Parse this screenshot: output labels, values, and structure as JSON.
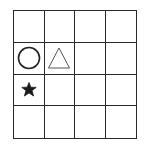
{
  "grid": {
    "rows": 4,
    "cols": 4,
    "line_color": "#2a2a2a",
    "shapes": [
      {
        "row": 1,
        "col": 0,
        "shape": "circle",
        "name": "circle-icon",
        "stroke": "#222222",
        "fill": "none"
      },
      {
        "row": 1,
        "col": 1,
        "shape": "triangle",
        "name": "triangle-icon",
        "stroke": "#555555",
        "fill": "none"
      },
      {
        "row": 2,
        "col": 0,
        "shape": "star",
        "name": "star-icon",
        "stroke": "#1a1a1a",
        "fill": "#1a1a1a"
      }
    ]
  }
}
